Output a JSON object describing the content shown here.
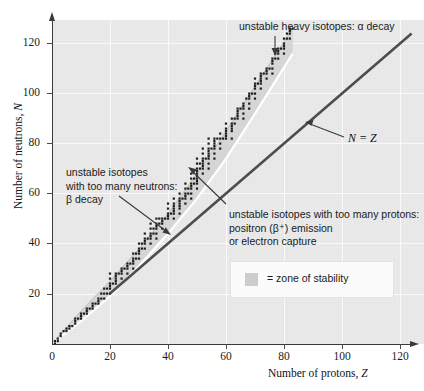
{
  "figure": {
    "background_color": "#e7e7e7",
    "page_color": "#ffffff"
  },
  "axes": {
    "x_title_prefix": "Number of protons, ",
    "x_title_symbol": "Z",
    "y_title_prefix": "Number of neutrons, ",
    "y_title_symbol": "N",
    "x_ticks": [
      "0",
      "20",
      "40",
      "60",
      "80",
      "100",
      "120"
    ],
    "y_ticks": [
      "20",
      "40",
      "60",
      "80",
      "100",
      "120"
    ]
  },
  "annotations": {
    "alpha": "unstable heavy isotopes: α decay",
    "beta_line1": "unstable isotopes",
    "beta_line2": "with too many neutrons:",
    "beta_line3": "β decay",
    "proton_line1": "unstable isotopes with too many protons:",
    "proton_line2": "positron (β⁺) emission",
    "proton_line3": "or electron capture",
    "nz_line": "N = Z"
  },
  "legend": {
    "text": "= zone of stability",
    "swatch_color": "#cdcdcd"
  },
  "chart_data": {
    "type": "scatter",
    "title": "",
    "xlabel": "Number of protons, Z",
    "ylabel": "Number of neutrons, N",
    "xlim": [
      0,
      124
    ],
    "ylim": [
      0,
      130
    ],
    "grid": true,
    "legend_position": "inside-lower-right",
    "series": [
      {
        "name": "zone of stability",
        "type": "band",
        "description": "shaded belt of stable nuclides between upper neutron-rich boundary and lower proton-rich boundary",
        "upper_boundary": [
          [
            0,
            0
          ],
          [
            10,
            13
          ],
          [
            20,
            25
          ],
          [
            30,
            38
          ],
          [
            40,
            52
          ],
          [
            50,
            68
          ],
          [
            60,
            85
          ],
          [
            70,
            103
          ],
          [
            83,
            126
          ]
        ],
        "lower_boundary": [
          [
            0,
            0
          ],
          [
            10,
            9
          ],
          [
            20,
            19
          ],
          [
            30,
            31
          ],
          [
            40,
            44
          ],
          [
            50,
            58
          ],
          [
            60,
            74
          ],
          [
            70,
            92
          ],
          [
            83,
            116
          ]
        ]
      },
      {
        "name": "N = Z",
        "type": "line",
        "x": [
          20,
          124
        ],
        "y": [
          20,
          124
        ]
      },
      {
        "name": "stable nuclides",
        "type": "scatter",
        "points": [
          [
            1,
            0
          ],
          [
            1,
            1
          ],
          [
            2,
            1
          ],
          [
            2,
            2
          ],
          [
            3,
            3
          ],
          [
            3,
            4
          ],
          [
            4,
            5
          ],
          [
            5,
            5
          ],
          [
            5,
            6
          ],
          [
            6,
            6
          ],
          [
            6,
            7
          ],
          [
            7,
            7
          ],
          [
            8,
            8
          ],
          [
            8,
            9
          ],
          [
            8,
            10
          ],
          [
            9,
            10
          ],
          [
            10,
            10
          ],
          [
            10,
            11
          ],
          [
            10,
            12
          ],
          [
            11,
            12
          ],
          [
            12,
            12
          ],
          [
            12,
            13
          ],
          [
            12,
            14
          ],
          [
            13,
            14
          ],
          [
            14,
            14
          ],
          [
            14,
            15
          ],
          [
            14,
            16
          ],
          [
            15,
            16
          ],
          [
            16,
            16
          ],
          [
            16,
            17
          ],
          [
            16,
            18
          ],
          [
            17,
            18
          ],
          [
            17,
            20
          ],
          [
            18,
            18
          ],
          [
            18,
            20
          ],
          [
            18,
            22
          ],
          [
            19,
            20
          ],
          [
            19,
            22
          ],
          [
            20,
            20
          ],
          [
            20,
            22
          ],
          [
            20,
            23
          ],
          [
            20,
            24
          ],
          [
            20,
            26
          ],
          [
            20,
            28
          ],
          [
            21,
            24
          ],
          [
            22,
            24
          ],
          [
            22,
            25
          ],
          [
            22,
            26
          ],
          [
            22,
            27
          ],
          [
            22,
            28
          ],
          [
            23,
            28
          ],
          [
            24,
            26
          ],
          [
            24,
            28
          ],
          [
            24,
            29
          ],
          [
            24,
            30
          ],
          [
            25,
            30
          ],
          [
            26,
            28
          ],
          [
            26,
            30
          ],
          [
            26,
            31
          ],
          [
            26,
            32
          ],
          [
            27,
            32
          ],
          [
            28,
            30
          ],
          [
            28,
            32
          ],
          [
            28,
            33
          ],
          [
            28,
            34
          ],
          [
            28,
            36
          ],
          [
            29,
            34
          ],
          [
            29,
            36
          ],
          [
            30,
            34
          ],
          [
            30,
            36
          ],
          [
            30,
            37
          ],
          [
            30,
            38
          ],
          [
            30,
            40
          ],
          [
            31,
            38
          ],
          [
            31,
            40
          ],
          [
            32,
            38
          ],
          [
            32,
            40
          ],
          [
            32,
            41
          ],
          [
            32,
            42
          ],
          [
            32,
            44
          ],
          [
            33,
            42
          ],
          [
            34,
            40
          ],
          [
            34,
            42
          ],
          [
            34,
            43
          ],
          [
            34,
            44
          ],
          [
            34,
            46
          ],
          [
            34,
            48
          ],
          [
            35,
            44
          ],
          [
            35,
            46
          ],
          [
            36,
            42
          ],
          [
            36,
            44
          ],
          [
            36,
            46
          ],
          [
            36,
            47
          ],
          [
            36,
            48
          ],
          [
            36,
            50
          ],
          [
            37,
            48
          ],
          [
            37,
            50
          ],
          [
            38,
            46
          ],
          [
            38,
            48
          ],
          [
            38,
            49
          ],
          [
            38,
            50
          ],
          [
            39,
            50
          ],
          [
            40,
            50
          ],
          [
            40,
            51
          ],
          [
            40,
            52
          ],
          [
            40,
            54
          ],
          [
            40,
            56
          ],
          [
            41,
            52
          ],
          [
            42,
            50
          ],
          [
            42,
            52
          ],
          [
            42,
            53
          ],
          [
            42,
            54
          ],
          [
            42,
            55
          ],
          [
            42,
            56
          ],
          [
            42,
            58
          ],
          [
            44,
            52
          ],
          [
            44,
            54
          ],
          [
            44,
            55
          ],
          [
            44,
            56
          ],
          [
            44,
            57
          ],
          [
            44,
            58
          ],
          [
            44,
            60
          ],
          [
            45,
            58
          ],
          [
            46,
            56
          ],
          [
            46,
            58
          ],
          [
            46,
            59
          ],
          [
            46,
            60
          ],
          [
            46,
            62
          ],
          [
            46,
            64
          ],
          [
            47,
            60
          ],
          [
            47,
            62
          ],
          [
            48,
            58
          ],
          [
            48,
            60
          ],
          [
            48,
            62
          ],
          [
            48,
            63
          ],
          [
            48,
            64
          ],
          [
            48,
            66
          ],
          [
            48,
            68
          ],
          [
            49,
            64
          ],
          [
            49,
            66
          ],
          [
            50,
            62
          ],
          [
            50,
            64
          ],
          [
            50,
            65
          ],
          [
            50,
            66
          ],
          [
            50,
            67
          ],
          [
            50,
            68
          ],
          [
            50,
            69
          ],
          [
            50,
            70
          ],
          [
            50,
            72
          ],
          [
            50,
            74
          ],
          [
            51,
            70
          ],
          [
            51,
            72
          ],
          [
            52,
            68
          ],
          [
            52,
            70
          ],
          [
            52,
            71
          ],
          [
            52,
            72
          ],
          [
            52,
            73
          ],
          [
            52,
            74
          ],
          [
            52,
            76
          ],
          [
            52,
            78
          ],
          [
            53,
            74
          ],
          [
            54,
            70
          ],
          [
            54,
            72
          ],
          [
            54,
            74
          ],
          [
            54,
            75
          ],
          [
            54,
            76
          ],
          [
            54,
            77
          ],
          [
            54,
            78
          ],
          [
            54,
            80
          ],
          [
            54,
            82
          ],
          [
            55,
            78
          ],
          [
            56,
            74
          ],
          [
            56,
            76
          ],
          [
            56,
            78
          ],
          [
            56,
            79
          ],
          [
            56,
            80
          ],
          [
            56,
            81
          ],
          [
            56,
            82
          ],
          [
            57,
            82
          ],
          [
            58,
            78
          ],
          [
            58,
            80
          ],
          [
            58,
            82
          ],
          [
            58,
            84
          ],
          [
            59,
            82
          ],
          [
            60,
            82
          ],
          [
            60,
            83
          ],
          [
            60,
            84
          ],
          [
            60,
            85
          ],
          [
            60,
            86
          ],
          [
            60,
            88
          ],
          [
            62,
            82
          ],
          [
            62,
            85
          ],
          [
            62,
            86
          ],
          [
            62,
            87
          ],
          [
            62,
            88
          ],
          [
            62,
            90
          ],
          [
            63,
            88
          ],
          [
            63,
            90
          ],
          [
            64,
            90
          ],
          [
            64,
            91
          ],
          [
            64,
            92
          ],
          [
            64,
            93
          ],
          [
            64,
            94
          ],
          [
            65,
            94
          ],
          [
            66,
            90
          ],
          [
            66,
            92
          ],
          [
            66,
            94
          ],
          [
            66,
            95
          ],
          [
            66,
            96
          ],
          [
            67,
            98
          ],
          [
            68,
            94
          ],
          [
            68,
            96
          ],
          [
            68,
            98
          ],
          [
            68,
            99
          ],
          [
            68,
            100
          ],
          [
            69,
            100
          ],
          [
            70,
            98
          ],
          [
            70,
            100
          ],
          [
            70,
            102
          ],
          [
            70,
            103
          ],
          [
            70,
            104
          ],
          [
            70,
            106
          ],
          [
            71,
            104
          ],
          [
            72,
            102
          ],
          [
            72,
            104
          ],
          [
            72,
            105
          ],
          [
            72,
            106
          ],
          [
            72,
            107
          ],
          [
            72,
            108
          ],
          [
            73,
            108
          ],
          [
            74,
            106
          ],
          [
            74,
            108
          ],
          [
            74,
            109
          ],
          [
            74,
            110
          ],
          [
            75,
            110
          ],
          [
            76,
            108
          ],
          [
            76,
            110
          ],
          [
            76,
            112
          ],
          [
            76,
            113
          ],
          [
            76,
            114
          ],
          [
            77,
            114
          ],
          [
            77,
            116
          ],
          [
            78,
            114
          ],
          [
            78,
            116
          ],
          [
            78,
            117
          ],
          [
            78,
            118
          ],
          [
            79,
            118
          ],
          [
            80,
            116
          ],
          [
            80,
            118
          ],
          [
            80,
            119
          ],
          [
            80,
            120
          ],
          [
            80,
            122
          ],
          [
            81,
            122
          ],
          [
            81,
            124
          ],
          [
            82,
            122
          ],
          [
            82,
            124
          ],
          [
            82,
            125
          ],
          [
            82,
            126
          ],
          [
            83,
            126
          ]
        ]
      }
    ]
  }
}
